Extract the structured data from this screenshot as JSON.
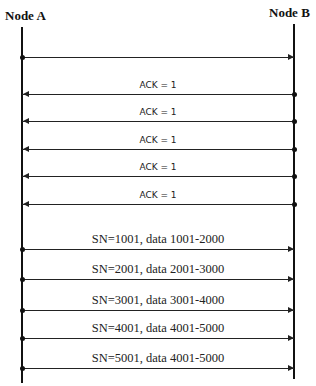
{
  "nodes": {
    "a": {
      "label": "Node A",
      "x": 22
    },
    "b": {
      "label": "Node B",
      "x": 294
    }
  },
  "messages": [
    {
      "label": "",
      "dir": "a-to-b",
      "y": 57,
      "kind": "sn"
    },
    {
      "label": "ACK = 1",
      "dir": "b-to-a",
      "y": 94,
      "kind": "ack"
    },
    {
      "label": "ACK = 1",
      "dir": "b-to-a",
      "y": 121,
      "kind": "ack"
    },
    {
      "label": "ACK = 1",
      "dir": "b-to-a",
      "y": 149,
      "kind": "ack"
    },
    {
      "label": "ACK = 1",
      "dir": "b-to-a",
      "y": 176,
      "kind": "ack"
    },
    {
      "label": "ACK = 1",
      "dir": "b-to-a",
      "y": 204,
      "kind": "ack"
    },
    {
      "label": "SN=1001, data 1001-2000",
      "dir": "a-to-b",
      "y": 249,
      "kind": "sn"
    },
    {
      "label": "SN=2001, data 2001-3000",
      "dir": "a-to-b",
      "y": 279,
      "kind": "sn"
    },
    {
      "label": "SN=3001, data 3001-4000",
      "dir": "a-to-b",
      "y": 310,
      "kind": "sn"
    },
    {
      "label": "SN=4001, data 4001-5000",
      "dir": "a-to-b",
      "y": 338,
      "kind": "sn"
    },
    {
      "label": "SN=5001, data 4001-5000",
      "dir": "a-to-b",
      "y": 368,
      "kind": "sn"
    }
  ]
}
